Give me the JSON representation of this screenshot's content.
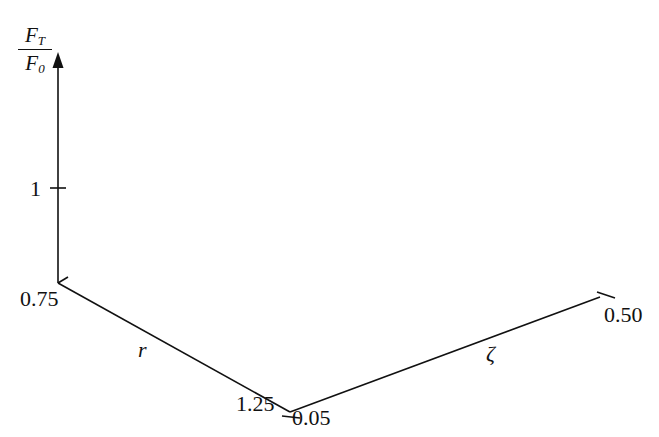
{
  "chart_data": {
    "type": "surface3d",
    "title": "",
    "formula": "F_T/F_0 = sqrt((1+(2*zeta*r)^2)/((1-r^2)^2+(2*zeta*r)^2))",
    "z_axis": {
      "label_num": "F",
      "label_num_sub": "T",
      "label_den": "F",
      "label_den_sub": "0",
      "ticks": [
        {
          "value": 1,
          "label": "1"
        }
      ]
    },
    "r_axis": {
      "label": "r",
      "min": 0.75,
      "max": 1.25,
      "tick_labels": [
        "0.75",
        "1.25"
      ]
    },
    "zeta_axis": {
      "label": "ζ",
      "min": 0.05,
      "max": 0.5,
      "tick_labels": [
        "0.05",
        "0.50"
      ]
    },
    "grid": {
      "r_steps": 40,
      "zeta_steps": 24
    },
    "peak": {
      "r": 1.0,
      "zeta": 0.05,
      "value": 10.05
    },
    "sample_values": [
      {
        "r": 0.75,
        "zeta": 0.05,
        "value": 2.29
      },
      {
        "r": 1.0,
        "zeta": 0.05,
        "value": 10.05
      },
      {
        "r": 1.25,
        "zeta": 0.05,
        "value": 1.79
      },
      {
        "r": 0.75,
        "zeta": 0.5,
        "value": 1.51
      },
      {
        "r": 1.0,
        "zeta": 0.5,
        "value": 1.41
      },
      {
        "r": 1.25,
        "zeta": 0.5,
        "value": 1.14
      }
    ],
    "legend": null
  },
  "labels": {
    "z_tick_1": "1",
    "r_min": "0.75",
    "r_max": "1.25",
    "r_name": "r",
    "zeta_min": "0.05",
    "zeta_max": "0.50",
    "zeta_name": "ζ",
    "frac_num": "F",
    "frac_num_sub": "T",
    "frac_den": "F",
    "frac_den_sub": "0"
  },
  "colors": {
    "axis": "#111111",
    "mesh": "#555555",
    "background": "#ffffff"
  }
}
